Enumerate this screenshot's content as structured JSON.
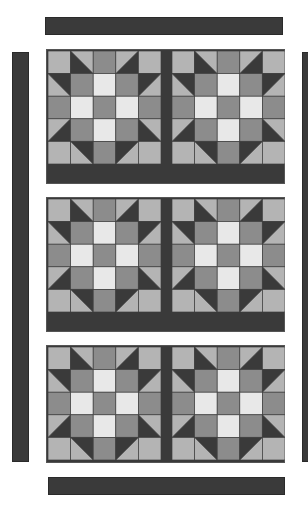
{
  "colors": {
    "background": "#ffffff",
    "dark": "#3a3a3a",
    "light": "#b4b4b4",
    "medium": "#8c8c8c",
    "mediumLight": "#9c9c9c",
    "white": "#e8e8e8",
    "gridLine": "#404040"
  },
  "layout": {
    "top_strip": {
      "x": 45,
      "y": 17,
      "w": 238,
      "h": 18
    },
    "bottom_strip": {
      "x": 48,
      "y": 477,
      "w": 237,
      "h": 18
    },
    "left_strip": {
      "x": 12,
      "y": 52,
      "w": 17,
      "h": 410
    },
    "right_strip": {
      "x": 302,
      "y": 52,
      "w": 10,
      "h": 410
    },
    "panels": [
      {
        "name": "panel-1",
        "x": 46,
        "y": 49,
        "w": 239,
        "h": 135,
        "blocks": [
          {
            "x": 48,
            "y": 51
          },
          {
            "x": 172,
            "y": 51
          }
        ]
      },
      {
        "name": "panel-2",
        "x": 46,
        "y": 197,
        "w": 239,
        "h": 135,
        "blocks": [
          {
            "x": 48,
            "y": 199
          },
          {
            "x": 172,
            "y": 199
          }
        ]
      },
      {
        "name": "panel-3",
        "x": 46,
        "y": 345,
        "w": 239,
        "h": 118,
        "blocks": [
          {
            "x": 48,
            "y": 347
          },
          {
            "x": 172,
            "y": 347
          }
        ]
      }
    ],
    "block_size": 113
  },
  "block_pattern": {
    "grid": 5,
    "cells": [
      [
        "L",
        "HST-TL",
        "M",
        "HST-TR",
        "L"
      ],
      [
        "HST-LT",
        "M",
        "W",
        "M",
        "HST-RT"
      ],
      [
        "M",
        "W",
        "M",
        "W",
        "M"
      ],
      [
        "HST-LB",
        "M",
        "W",
        "M",
        "HST-RB"
      ],
      [
        "L",
        "HST-BL",
        "M",
        "HST-BR",
        "L"
      ]
    ]
  }
}
